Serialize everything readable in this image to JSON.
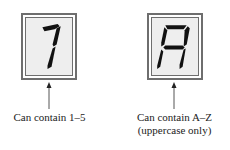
{
  "displays": [
    {
      "character": "1",
      "caption_lines": [
        "Can contain 1–5"
      ],
      "icon": "seven-segment-digit-1"
    },
    {
      "character": "A",
      "caption_lines": [
        "Can contain A–Z",
        "(uppercase only)"
      ],
      "icon": "seven-segment-letter-A"
    }
  ],
  "colors": {
    "frame": "#6e6e6e",
    "display_bg": "#eeeeee",
    "segment": "#111111",
    "text": "#222222"
  }
}
